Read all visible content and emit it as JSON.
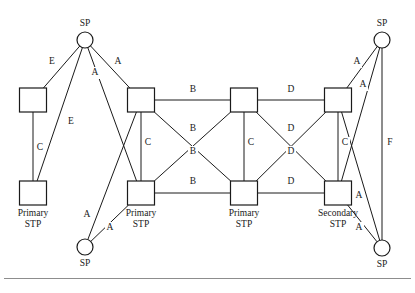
{
  "diagram": {
    "colors": {
      "stroke": "#1a1a1a",
      "background": "#ffffff",
      "rule": "#8d8d8d"
    },
    "nodes": [
      {
        "id": "sp_top_left",
        "kind": "circle",
        "x": 85,
        "y": 40,
        "r": 8,
        "label": "SP",
        "label_lines": [
          "SP"
        ],
        "label_pos": "above"
      },
      {
        "id": "sp_bottom_left",
        "kind": "circle",
        "x": 85,
        "y": 247,
        "r": 8,
        "label": "SP",
        "label_lines": [
          "SP"
        ],
        "label_pos": "below"
      },
      {
        "id": "sp_top_right",
        "kind": "circle",
        "x": 382,
        "y": 40,
        "r": 8,
        "label": "SP",
        "label_lines": [
          "SP"
        ],
        "label_pos": "above"
      },
      {
        "id": "sp_bottom_right",
        "kind": "circle",
        "x": 382,
        "y": 248,
        "r": 8,
        "label": "SP",
        "label_lines": [
          "SP"
        ],
        "label_pos": "below"
      },
      {
        "id": "stp_far_left_top",
        "kind": "square",
        "x": 33,
        "y": 100,
        "w": 27,
        "h": 24,
        "label": "",
        "label_lines": [],
        "label_pos": "below"
      },
      {
        "id": "stp_far_left_bot",
        "kind": "square",
        "x": 33,
        "y": 193,
        "w": 27,
        "h": 24,
        "label": "Primary STP",
        "label_lines": [
          "Primary",
          "STP"
        ],
        "label_pos": "below"
      },
      {
        "id": "stp_a_top",
        "kind": "square",
        "x": 141,
        "y": 100,
        "w": 27,
        "h": 24,
        "label": "",
        "label_lines": [],
        "label_pos": "below"
      },
      {
        "id": "stp_a_bot",
        "kind": "square",
        "x": 141,
        "y": 193,
        "w": 27,
        "h": 24,
        "label": "Primary STP",
        "label_lines": [
          "Primary",
          "STP"
        ],
        "label_pos": "below"
      },
      {
        "id": "stp_b_top",
        "kind": "square",
        "x": 244,
        "y": 100,
        "w": 27,
        "h": 24,
        "label": "",
        "label_lines": [],
        "label_pos": "below"
      },
      {
        "id": "stp_b_bot",
        "kind": "square",
        "x": 244,
        "y": 193,
        "w": 27,
        "h": 24,
        "label": "Primary STP",
        "label_lines": [
          "Primary",
          "STP"
        ],
        "label_pos": "below"
      },
      {
        "id": "stp_c_top",
        "kind": "square",
        "x": 338,
        "y": 100,
        "w": 27,
        "h": 24,
        "label": "",
        "label_lines": [],
        "label_pos": "below"
      },
      {
        "id": "stp_c_bot",
        "kind": "square",
        "x": 338,
        "y": 193,
        "w": 27,
        "h": 24,
        "label": "Secondary STP",
        "label_lines": [
          "Secondary",
          "STP"
        ],
        "label_pos": "below"
      }
    ],
    "links": [
      {
        "id": "l_e1",
        "from": "sp_top_left",
        "to": "stp_far_left_top",
        "label": "E",
        "lx": 52,
        "ly": 62
      },
      {
        "id": "l_e2",
        "from": "sp_top_left",
        "to": "stp_far_left_bot",
        "label": "E",
        "lx": 71,
        "ly": 122
      },
      {
        "id": "l_c0",
        "from": "stp_far_left_top",
        "to": "stp_far_left_bot",
        "label": "C",
        "lx": 40,
        "ly": 148
      },
      {
        "id": "l_a1",
        "from": "sp_top_left",
        "to": "stp_a_top",
        "label": "A",
        "lx": 118,
        "ly": 62
      },
      {
        "id": "l_a2",
        "from": "sp_top_left",
        "to": "stp_a_bot",
        "label": "A",
        "lx": 95,
        "ly": 73
      },
      {
        "id": "l_a3",
        "from": "sp_bottom_left",
        "to": "stp_a_top",
        "label": "A",
        "lx": 87,
        "ly": 215
      },
      {
        "id": "l_a4",
        "from": "sp_bottom_left",
        "to": "stp_a_bot",
        "label": "A",
        "lx": 110,
        "ly": 228
      },
      {
        "id": "l_b1",
        "from": "stp_a_top",
        "to": "stp_b_top",
        "label": "B",
        "lx": 193,
        "ly": 90
      },
      {
        "id": "l_b2",
        "from": "stp_a_top",
        "to": "stp_b_bot",
        "label": "B",
        "lx": 193,
        "ly": 129
      },
      {
        "id": "l_b3",
        "from": "stp_a_bot",
        "to": "stp_b_top",
        "label": "B",
        "lx": 193,
        "ly": 152
      },
      {
        "id": "l_b4",
        "from": "stp_a_bot",
        "to": "stp_b_bot",
        "label": "B",
        "lx": 193,
        "ly": 182
      },
      {
        "id": "l_ca",
        "from": "stp_a_top",
        "to": "stp_a_bot",
        "label": "C",
        "lx": 148,
        "ly": 143
      },
      {
        "id": "l_cb",
        "from": "stp_b_top",
        "to": "stp_b_bot",
        "label": "C",
        "lx": 251,
        "ly": 143
      },
      {
        "id": "l_cc",
        "from": "stp_c_top",
        "to": "stp_c_bot",
        "label": "C",
        "lx": 345,
        "ly": 143
      },
      {
        "id": "l_d1",
        "from": "stp_b_top",
        "to": "stp_c_top",
        "label": "D",
        "lx": 291,
        "ly": 90
      },
      {
        "id": "l_d2",
        "from": "stp_b_top",
        "to": "stp_c_bot",
        "label": "D",
        "lx": 291,
        "ly": 129
      },
      {
        "id": "l_d3",
        "from": "stp_b_bot",
        "to": "stp_c_top",
        "label": "D",
        "lx": 291,
        "ly": 152
      },
      {
        "id": "l_d4",
        "from": "stp_b_bot",
        "to": "stp_c_bot",
        "label": "D",
        "lx": 291,
        "ly": 182
      },
      {
        "id": "l_a5",
        "from": "sp_top_right",
        "to": "stp_c_top",
        "label": "A",
        "lx": 357,
        "ly": 62
      },
      {
        "id": "l_a6",
        "from": "sp_top_right",
        "to": "stp_c_bot",
        "label": "A",
        "lx": 363,
        "ly": 85
      },
      {
        "id": "l_a7",
        "from": "sp_bottom_right",
        "to": "stp_c_top",
        "label": "A",
        "lx": 359,
        "ly": 196
      },
      {
        "id": "l_a8",
        "from": "sp_bottom_right",
        "to": "stp_c_bot",
        "label": "A",
        "lx": 359,
        "ly": 228
      },
      {
        "id": "l_f",
        "from": "sp_top_right",
        "to": "sp_bottom_right",
        "label": "F",
        "lx": 390,
        "ly": 143
      }
    ]
  }
}
